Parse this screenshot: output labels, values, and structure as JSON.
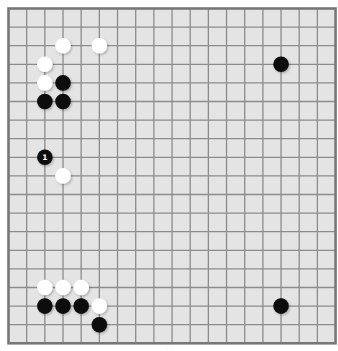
{
  "board": {
    "size": 19,
    "background": "#e4e4e4",
    "line_color": "#8c8c8c",
    "border_color": "#777777",
    "origin_x": 8.5,
    "origin_y": 8.5,
    "step_x": 18.17,
    "step_y": 18.6,
    "stone_radius": 7.8
  },
  "stones": [
    {
      "color": "white",
      "col": 3,
      "row": 2
    },
    {
      "color": "white",
      "col": 5,
      "row": 2
    },
    {
      "color": "white",
      "col": 2,
      "row": 3
    },
    {
      "color": "white",
      "col": 2,
      "row": 4
    },
    {
      "color": "black",
      "col": 3,
      "row": 4
    },
    {
      "color": "black",
      "col": 2,
      "row": 5
    },
    {
      "color": "black",
      "col": 3,
      "row": 5
    },
    {
      "color": "black",
      "col": 15,
      "row": 3
    },
    {
      "color": "black",
      "col": 2,
      "row": 8,
      "label": "1"
    },
    {
      "color": "white",
      "col": 3,
      "row": 9
    },
    {
      "color": "white",
      "col": 2,
      "row": 15
    },
    {
      "color": "white",
      "col": 3,
      "row": 15
    },
    {
      "color": "white",
      "col": 4,
      "row": 15
    },
    {
      "color": "black",
      "col": 2,
      "row": 16
    },
    {
      "color": "black",
      "col": 3,
      "row": 16
    },
    {
      "color": "black",
      "col": 4,
      "row": 16
    },
    {
      "color": "white",
      "col": 5,
      "row": 16
    },
    {
      "color": "black",
      "col": 5,
      "row": 17
    },
    {
      "color": "black",
      "col": 15,
      "row": 16
    }
  ],
  "caption": "· ·"
}
